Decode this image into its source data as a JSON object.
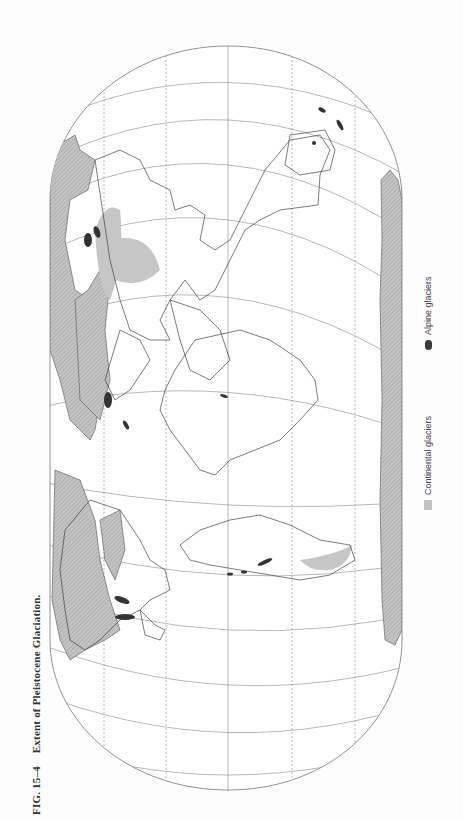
{
  "caption": {
    "figure_number": "FIG. 15–4",
    "title": "Extent of Pleistocene Glaciation."
  },
  "legend": {
    "items": [
      {
        "label": "Continental glaciers",
        "symbol": "hatched-gray-swatch",
        "color": "#c2c2c2"
      },
      {
        "label": "Alpine glaciers",
        "symbol": "dark-blob",
        "color": "#3a3a3a"
      }
    ]
  },
  "map": {
    "projection": "oval world projection (rotated 90°)",
    "graticule": {
      "central_meridian": "solid",
      "other_meridians": "dashed",
      "parallels": "solid curved"
    },
    "colors": {
      "coastline": "#444444",
      "graticule": "#888888",
      "continental_ice": "#b8b8b8",
      "alpine_ice": "#333333"
    }
  }
}
